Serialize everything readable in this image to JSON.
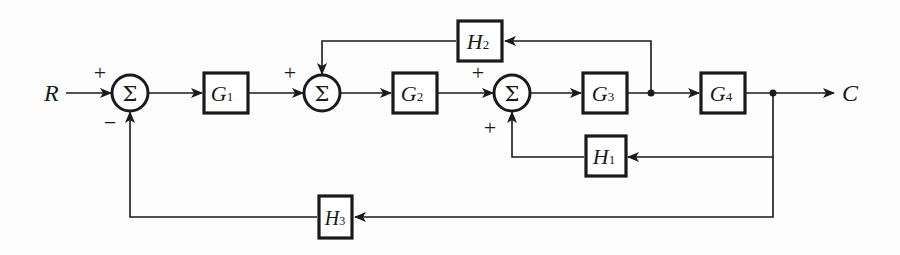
{
  "diagram": {
    "type": "block-diagram",
    "input": {
      "label": "R"
    },
    "output": {
      "label": "C"
    },
    "summing_junctions": [
      {
        "id": "sum1",
        "symbol": "Σ",
        "signs": [
          "+",
          "−"
        ]
      },
      {
        "id": "sum2",
        "symbol": "Σ",
        "signs": [
          "+",
          "+"
        ]
      },
      {
        "id": "sum3",
        "symbol": "Σ",
        "signs": [
          "+",
          "+"
        ]
      }
    ],
    "blocks": [
      {
        "id": "G1",
        "name": "G",
        "sub": "1"
      },
      {
        "id": "G2",
        "name": "G",
        "sub": "2"
      },
      {
        "id": "G3",
        "name": "G",
        "sub": "3"
      },
      {
        "id": "G4",
        "name": "G",
        "sub": "4"
      },
      {
        "id": "H1",
        "name": "H",
        "sub": "1"
      },
      {
        "id": "H2",
        "name": "H",
        "sub": "2"
      },
      {
        "id": "H3",
        "name": "H",
        "sub": "3"
      }
    ],
    "connections": [
      {
        "from": "R",
        "to": "sum1",
        "sign": "+"
      },
      {
        "from": "sum1",
        "to": "G1"
      },
      {
        "from": "G1",
        "to": "sum2",
        "sign": "+"
      },
      {
        "from": "sum2",
        "to": "G2"
      },
      {
        "from": "G2",
        "to": "sum3",
        "sign": "+"
      },
      {
        "from": "sum3",
        "to": "G3"
      },
      {
        "from": "G3",
        "to": "G4"
      },
      {
        "from": "G4",
        "to": "C"
      },
      {
        "from": "G3-output",
        "to": "H2"
      },
      {
        "from": "H2",
        "to": "sum2",
        "sign": "+"
      },
      {
        "from": "C",
        "to": "H1"
      },
      {
        "from": "H1",
        "to": "sum3",
        "sign": "+"
      },
      {
        "from": "C",
        "to": "H3"
      },
      {
        "from": "H3",
        "to": "sum1",
        "sign": "−"
      }
    ]
  }
}
